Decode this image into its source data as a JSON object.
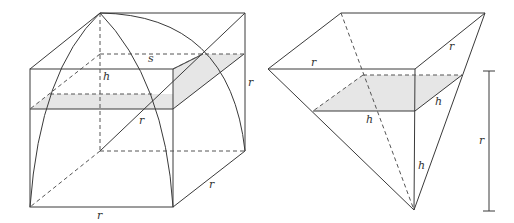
{
  "figures": [
    {
      "id": "cube-with-dome",
      "labels": {
        "s": "s",
        "h": "h",
        "r_diag": "r",
        "r_right": "r",
        "r_depth": "r",
        "r_bottom": "r"
      }
    },
    {
      "id": "inverted-pyramid",
      "labels": {
        "r_top_left": "r",
        "r_top_right": "r",
        "h_slab_front": "h",
        "h_slab_side": "h",
        "h_vertical": "h",
        "r_measure": "r"
      }
    }
  ],
  "colors": {
    "line": "#3a3a3a",
    "shading": "#e6e6e6",
    "background": "#ffffff"
  }
}
